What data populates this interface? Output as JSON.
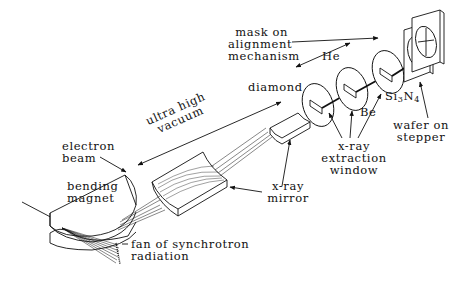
{
  "diagram": {
    "labels": {
      "mask_line1": "mask on",
      "mask_line2": "alignment",
      "mask_line3": "mechanism",
      "he": "He",
      "diamond": "diamond",
      "uhv_line1": "ultra high",
      "uhv_line2": "vacuum",
      "electron_line1": "electron",
      "electron_line2": "beam",
      "bending_line1": "bending",
      "bending_line2": "magnet",
      "fan_line1": "fan of synchrotron",
      "fan_line2": "radiation",
      "mirror_line1": "x-ray",
      "mirror_line2": "mirror",
      "be": "Be",
      "si": "Si",
      "si_sub3": "3",
      "n": "N",
      "n_sub4": "4",
      "window_line1": "x-ray",
      "window_line2": "extraction",
      "window_line3": "window",
      "wafer_line1": "wafer on",
      "wafer_line2": "stepper"
    },
    "colors": {
      "line": "#111111",
      "background": "#ffffff"
    }
  }
}
